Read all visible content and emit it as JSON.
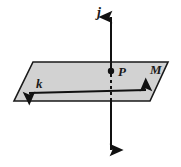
{
  "figure": {
    "type": "geometry-diagram",
    "background_color": "#ffffff",
    "plane": {
      "name": "plane-M",
      "label": "M",
      "fill_color": "#d2d2d2",
      "stroke_color": "#1a1a1a",
      "stroke_width": 1.6,
      "points": "33,62 168,62 150,101 14,101",
      "label_position": {
        "x": 150,
        "y": 73
      }
    },
    "line_k": {
      "name": "line-k",
      "label": "k",
      "color": "#111111",
      "stroke_width": 2,
      "x1": 24,
      "y1": 93,
      "x2": 151,
      "y2": 90,
      "label_position": {
        "x": 36,
        "y": 87
      },
      "arrowheads": "both"
    },
    "line_j": {
      "name": "line-j",
      "label": "j",
      "color": "#111111",
      "stroke_width": 2,
      "x": 111,
      "y_top": 11,
      "y_bottom": 156,
      "label_position": {
        "x": 99,
        "y": 16
      },
      "arrowheads": "both",
      "hidden_segment": {
        "note": "dashed where the line passes behind/through the plane",
        "y_start": 75,
        "y_end": 98,
        "dash_pattern": "3,3"
      }
    },
    "point_P": {
      "name": "point-P",
      "label": "P",
      "x": 111,
      "y": 71,
      "radius": 3,
      "color": "#111111",
      "label_position": {
        "x": 117,
        "y": 75
      }
    }
  }
}
